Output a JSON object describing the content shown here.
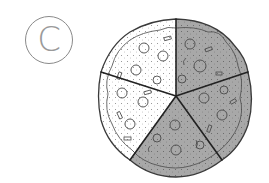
{
  "figure": {
    "label": "C",
    "total_slices": 5,
    "shaded_slices": 3,
    "unshaded_slices": 2,
    "fraction_shaded": "3/5"
  },
  "pizza": {
    "center": [
      176,
      96
    ],
    "radius": 78,
    "slices": [
      {
        "id": "top-right",
        "shaded": true
      },
      {
        "id": "right",
        "shaded": true
      },
      {
        "id": "bottom",
        "shaded": true
      },
      {
        "id": "left",
        "shaded": false
      },
      {
        "id": "top-left",
        "shaded": false
      }
    ]
  },
  "colors": {
    "shaded": "#a8a8a8",
    "unshaded": "#ffffff",
    "outline": "#2a2a2a",
    "label": "#9a9a9a"
  }
}
